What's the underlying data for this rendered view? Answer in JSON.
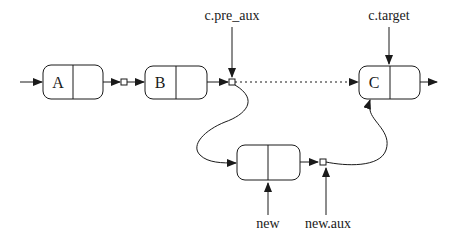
{
  "diagram": {
    "nodes": [
      {
        "id": "A",
        "label": "A"
      },
      {
        "id": "B",
        "label": "B"
      },
      {
        "id": "C",
        "label": "C"
      },
      {
        "id": "new",
        "label": ""
      }
    ],
    "pointers": {
      "c_pre_aux": "c.pre_aux",
      "c_target": "c.target",
      "new": "new",
      "new_aux": "new.aux"
    },
    "edges": [
      {
        "from": "entry",
        "to": "A",
        "style": "solid"
      },
      {
        "from": "A",
        "to": "link-AB",
        "style": "solid"
      },
      {
        "from": "link-AB",
        "to": "B",
        "style": "solid"
      },
      {
        "from": "B",
        "to": "c.pre_aux",
        "style": "solid"
      },
      {
        "from": "c.pre_aux",
        "to": "C",
        "style": "dotted"
      },
      {
        "from": "c.pre_aux",
        "to": "new",
        "style": "curved"
      },
      {
        "from": "new",
        "to": "new.aux",
        "style": "solid"
      },
      {
        "from": "new.aux",
        "to": "C",
        "style": "curved"
      },
      {
        "from": "C",
        "to": "exit",
        "style": "solid"
      }
    ],
    "colors": {
      "ink": "#1a1a1a",
      "background": "#ffffff"
    }
  }
}
